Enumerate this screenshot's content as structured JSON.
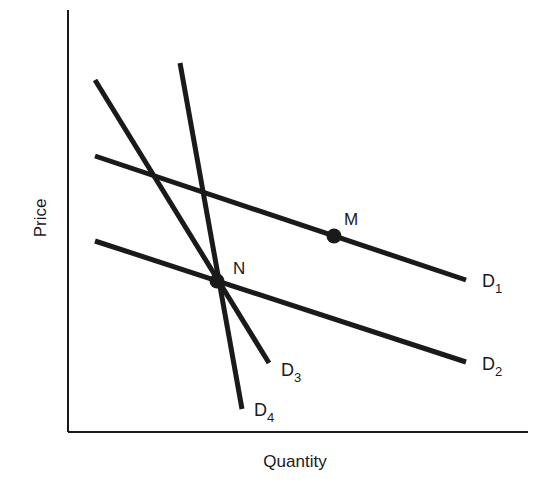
{
  "chart_data": {
    "type": "line",
    "title": "",
    "xlabel": "Quantity",
    "ylabel": "Price",
    "grid": false,
    "legend": "none (curves labeled inline)",
    "axes": {
      "origin_px": [
        68,
        432
      ],
      "x_end_px": [
        528,
        432
      ],
      "y_end_px": [
        68,
        10
      ]
    },
    "series": [
      {
        "name": "D1",
        "label_main": "D",
        "label_sub": "1",
        "x1": 95,
        "y1": 156,
        "x2": 466,
        "y2": 280,
        "label_pos": [
          482,
          287
        ]
      },
      {
        "name": "D2",
        "label_main": "D",
        "label_sub": "2",
        "x1": 95,
        "y1": 241,
        "x2": 466,
        "y2": 362,
        "label_pos": [
          482,
          370
        ]
      },
      {
        "name": "D3",
        "label_main": "D",
        "label_sub": "3",
        "x1": 95,
        "y1": 80,
        "x2": 269,
        "y2": 363,
        "label_pos": [
          281,
          376
        ]
      },
      {
        "name": "D4",
        "label_main": "D",
        "label_sub": "4",
        "x1": 180,
        "y1": 63,
        "x2": 242,
        "y2": 409,
        "label_pos": [
          254,
          416
        ]
      }
    ],
    "points": [
      {
        "name": "M",
        "x": 334,
        "y": 236,
        "label_pos": [
          344,
          225
        ]
      },
      {
        "name": "N",
        "x": 217,
        "y": 281,
        "label_pos": [
          233,
          274
        ]
      }
    ]
  },
  "colors": {
    "ink": "#1a1a1a",
    "background": "#ffffff"
  }
}
